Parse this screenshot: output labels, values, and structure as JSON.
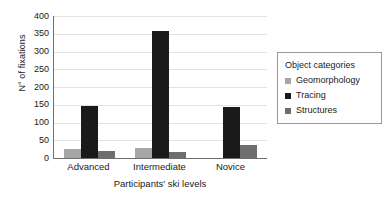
{
  "chart_data": {
    "type": "bar",
    "title": "",
    "subtitle": "",
    "xlabel": "Participants' ski levels",
    "ylabel": "N° of fixations",
    "categories": [
      "Advanced",
      "Intermediate",
      "Novice"
    ],
    "series": [
      {
        "name": "Geomorphology",
        "color": "#a6a6a6",
        "values": [
          25,
          28,
          0
        ]
      },
      {
        "name": "Tracing",
        "color": "#1a1a1a",
        "values": [
          147,
          357,
          143
        ]
      },
      {
        "name": "Structures",
        "color": "#6e6e6e",
        "values": [
          20,
          16,
          38
        ]
      }
    ],
    "ylim": [
      0,
      400
    ],
    "ytick_step": 50,
    "yticks": [
      400,
      350,
      300,
      250,
      200,
      150,
      100,
      50,
      0
    ],
    "ytick_labels": [
      "400",
      "350",
      "300",
      "250",
      "200",
      "150",
      "100",
      "50",
      "0"
    ],
    "grid": true,
    "grid_axis": "y",
    "legend": {
      "position": "right",
      "title": "Object categories",
      "boxed": true,
      "entries": [
        {
          "label": "Geomorphology",
          "color": "#a6a6a6"
        },
        {
          "label": "Tracing",
          "color": "#1a1a1a"
        },
        {
          "label": "Structures",
          "color": "#6e6e6e"
        }
      ]
    },
    "colors": {
      "geomorphology": "#a6a6a6",
      "tracing": "#1a1a1a",
      "structures": "#6e6e6e",
      "axis": "#6e6e6e",
      "grid": "#e2e2e2",
      "legend_border": "#9a9a9a",
      "background": "#ffffff",
      "text": "#1a1a1a"
    }
  }
}
